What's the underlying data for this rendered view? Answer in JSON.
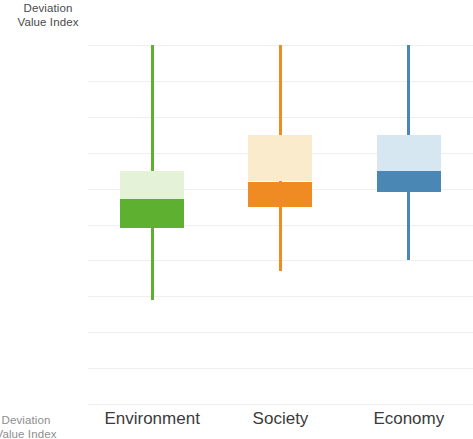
{
  "axis_title": {
    "line1": "Deviation",
    "line2": "Value Index"
  },
  "axis_title_bottom": {
    "line1": "Deviation",
    "line2": "Value Index"
  },
  "chart_data": {
    "type": "box",
    "title": "",
    "subtitle": "",
    "xlabel": "",
    "ylabel": "Deviation Value Index",
    "ylim": [
      0,
      100
    ],
    "yticks": [
      100,
      90,
      80,
      70,
      60,
      50,
      40,
      30,
      20,
      10,
      0
    ],
    "grid": true,
    "legend": "none",
    "categories": [
      "Environment",
      "Society",
      "Economy"
    ],
    "series": [
      {
        "name": "Environment",
        "whisker_low": 29,
        "q1": 49,
        "median": 57,
        "q3": 65,
        "whisker_high": 100,
        "color": "#5EB031",
        "color_light": "#E4F2D8"
      },
      {
        "name": "Society",
        "whisker_low": 37,
        "q1": 55,
        "median": 62,
        "q3": 75,
        "whisker_high": 100,
        "color": "#F08A23",
        "color_light": "#FAEBCD"
      },
      {
        "name": "Economy",
        "whisker_low": 40,
        "q1": 59,
        "median": 65,
        "q3": 75,
        "whisker_high": 100,
        "color": "#4A87B5",
        "color_light": "#D6E7F1"
      }
    ]
  }
}
